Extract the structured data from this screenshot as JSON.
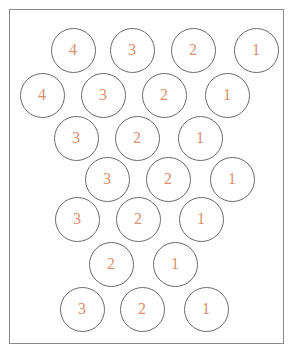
{
  "diagram": {
    "number_color": "#d9906c",
    "circle_stroke": "#6b6b6b",
    "rows": [
      {
        "y": 50,
        "circles": [
          {
            "x": 73,
            "label": "4"
          },
          {
            "x": 132,
            "label": "3"
          },
          {
            "x": 193,
            "label": "2"
          },
          {
            "x": 256,
            "label": "1"
          }
        ]
      },
      {
        "y": 95,
        "circles": [
          {
            "x": 42,
            "label": "4"
          },
          {
            "x": 103,
            "label": "3"
          },
          {
            "x": 164,
            "label": "2"
          },
          {
            "x": 227,
            "label": "1"
          }
        ]
      },
      {
        "y": 138,
        "circles": [
          {
            "x": 76,
            "label": "3"
          },
          {
            "x": 137,
            "label": "2"
          },
          {
            "x": 200,
            "label": "1"
          }
        ]
      },
      {
        "y": 179,
        "circles": [
          {
            "x": 107,
            "label": "3"
          },
          {
            "x": 168,
            "label": "2"
          },
          {
            "x": 232,
            "label": "1"
          }
        ]
      },
      {
        "y": 219,
        "circles": [
          {
            "x": 77,
            "label": "3"
          },
          {
            "x": 138,
            "label": "2"
          },
          {
            "x": 201,
            "label": "1"
          }
        ]
      },
      {
        "y": 264,
        "circles": [
          {
            "x": 111,
            "label": "2"
          },
          {
            "x": 175,
            "label": "1"
          }
        ]
      },
      {
        "y": 309,
        "circles": [
          {
            "x": 82,
            "label": "3"
          },
          {
            "x": 142,
            "label": "2"
          },
          {
            "x": 206,
            "label": "1"
          }
        ]
      }
    ]
  }
}
